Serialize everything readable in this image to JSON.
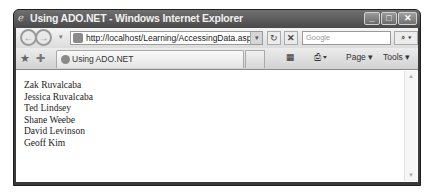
{
  "window": {
    "title": "Using ADO.NET - Windows Internet Explorer",
    "buttons": {
      "minimize": "_",
      "maximize": "□",
      "close": "✕"
    }
  },
  "navbar": {
    "back_glyph": "←",
    "forward_glyph": "→",
    "dropdown_glyph": "▾",
    "address_url": "http://localhost/Learning/AccessingData.aspx",
    "refresh_glyph": "↻",
    "stop_glyph": "✕",
    "search_placeholder": "Google",
    "search_glyph": "⌕ ▾"
  },
  "tabbar": {
    "favorites_glyph": "★",
    "add_favorites_glyph": "✚",
    "active_tab_label": "Using ADO.NET",
    "commands": {
      "home": "▦",
      "print": "⎙ ▾",
      "page": "Page ▾",
      "tools": "Tools ▾"
    }
  },
  "content": {
    "names": [
      "Zak Ruvalcaba",
      "Jessica Ruvalcaba",
      "Ted Lindsey",
      "Shane Weebe",
      "David Levinson",
      "Geoff Kim"
    ]
  },
  "scrollbar": {
    "up_glyph": "▲",
    "down_glyph": "▼"
  }
}
